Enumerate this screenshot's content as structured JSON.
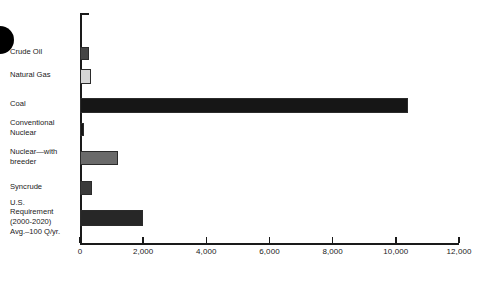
{
  "chart_data": {
    "type": "bar",
    "orientation": "horizontal",
    "title": "",
    "subtitle": "",
    "xlabel": "",
    "ylabel": "",
    "xlim": [
      0,
      12000
    ],
    "grid": false,
    "legend": false,
    "xticks": [
      0,
      2000,
      4000,
      6000,
      8000,
      10000,
      12000
    ],
    "xticklabels": [
      "0",
      "2,000",
      "4,000",
      "6,000",
      "8,000",
      "10,000",
      "12,000"
    ],
    "categories": [
      "Crude Oil",
      "Natural Gas",
      "Coal",
      "Conventional\nNuclear",
      "Nuclear—with\nbreeder",
      "Syncrude",
      "U.S.\nRequirement\n(2000-2020)\nAvg.–100 Q/yr."
    ],
    "values": [
      280,
      350,
      10400,
      120,
      1200,
      380,
      2000
    ],
    "bar_colors": [
      "#454545",
      "#d6d6d6",
      "#161616",
      "#161616",
      "#6a6a6a",
      "#3a3a3a",
      "#272727"
    ]
  },
  "axis": {
    "tick_color": "#1a1a1a",
    "line_color": "#1a1a1a"
  },
  "decor": {
    "corner_dot": "black-circle-mark"
  }
}
